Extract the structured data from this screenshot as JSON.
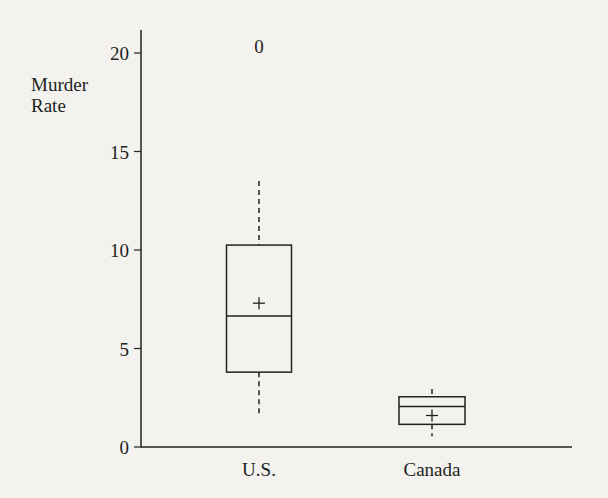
{
  "chart_data": {
    "type": "boxplot",
    "title": "",
    "xlabel": "",
    "ylabel": "Murder Rate",
    "ylabel_lines": [
      "Murder",
      "Rate"
    ],
    "ylim": [
      0,
      20
    ],
    "yticks": [
      0,
      5,
      10,
      15,
      20
    ],
    "grid": false,
    "legend": null,
    "categories": [
      "U.S.",
      "Canada"
    ],
    "series": [
      {
        "name": "U.S.",
        "whisker_low": 1.7,
        "q1": 3.8,
        "median": 6.65,
        "mean": 7.3,
        "q3": 10.25,
        "whisker_high": 13.5,
        "outliers": [
          20.3
        ],
        "outlier_marker": "0"
      },
      {
        "name": "Canada",
        "whisker_low": 0.55,
        "q1": 1.15,
        "median": 2.05,
        "mean": 1.6,
        "q3": 2.55,
        "whisker_high": 2.95,
        "outliers": []
      }
    ],
    "markers": {
      "mean": "+",
      "outlier": "0"
    },
    "whisker_style": "dashed"
  },
  "colors": {
    "background": "#f3f2ef",
    "ink": "#222222"
  }
}
